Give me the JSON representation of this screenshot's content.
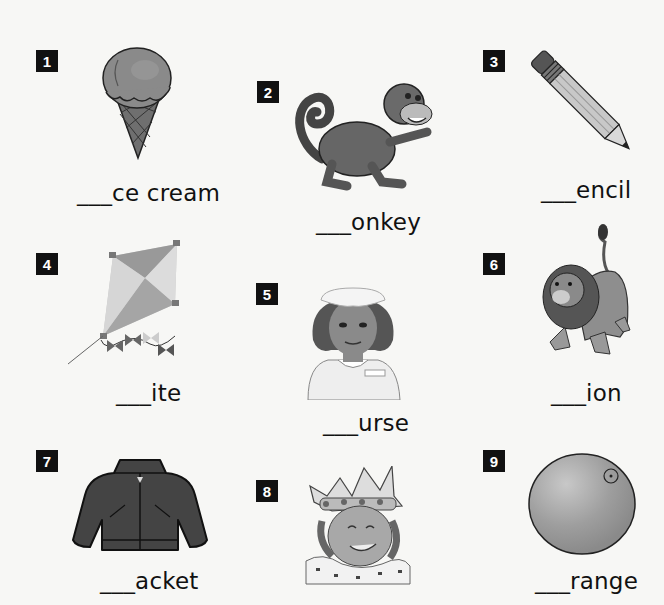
{
  "worksheet": {
    "items": [
      {
        "number": "1",
        "picture": "ice cream cone",
        "word_suffix": "ce cream",
        "blank": "___",
        "answer_letter": "i"
      },
      {
        "number": "2",
        "picture": "monkey",
        "word_suffix": "onkey",
        "blank": "___",
        "answer_letter": "m"
      },
      {
        "number": "3",
        "picture": "pencil",
        "word_suffix": "encil",
        "blank": "___",
        "answer_letter": "p"
      },
      {
        "number": "4",
        "picture": "kite",
        "word_suffix": "ite",
        "blank": "___",
        "answer_letter": "k"
      },
      {
        "number": "5",
        "picture": "nurse",
        "word_suffix": "urse",
        "blank": "___",
        "answer_letter": "n"
      },
      {
        "number": "6",
        "picture": "lion",
        "word_suffix": "ion",
        "blank": "___",
        "answer_letter": "l"
      },
      {
        "number": "7",
        "picture": "jacket",
        "word_suffix": "acket",
        "blank": "___",
        "answer_letter": "j"
      },
      {
        "number": "8",
        "picture": "queen",
        "word_suffix": null,
        "blank": null,
        "answer_letter": "q"
      },
      {
        "number": "9",
        "picture": "orange",
        "word_suffix": "range",
        "blank": "___",
        "answer_letter": "o"
      }
    ]
  },
  "colors": {
    "background": "#f7f7f5",
    "badge": "#111111",
    "badge_text": "#ffffff",
    "text": "#111111"
  }
}
